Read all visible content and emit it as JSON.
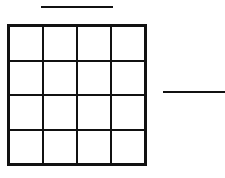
{
  "diagram": {
    "type": "grid-puzzle",
    "grid": {
      "rows": 4,
      "cols": 4,
      "cells": [
        "",
        "",
        "",
        "",
        "",
        "",
        "",
        "",
        "",
        "",
        "",
        "",
        "",
        "",
        "",
        ""
      ]
    },
    "answer_blanks": [
      {
        "position": "top",
        "value": ""
      },
      {
        "position": "right",
        "value": ""
      }
    ],
    "line_color": "#111111"
  }
}
